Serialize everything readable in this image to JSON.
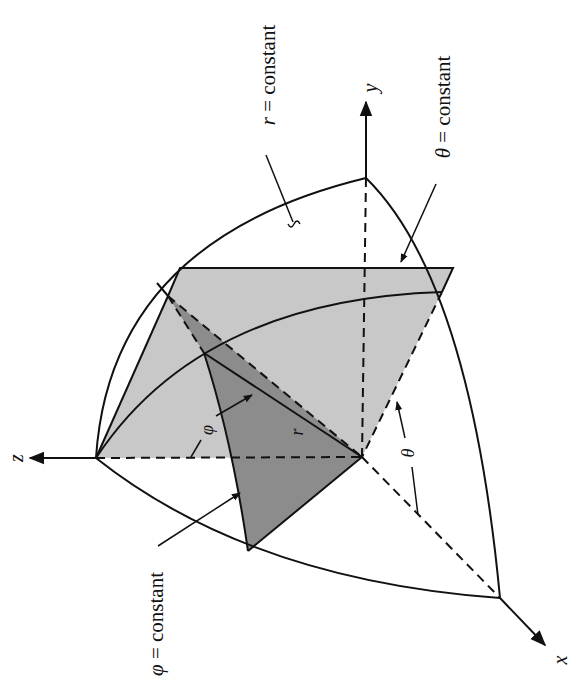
{
  "figure": {
    "colors": {
      "line": "#111111",
      "light_plane": "#c8c8c8",
      "dark_sector": "#8c8c8c",
      "background": "#ffffff"
    }
  },
  "axes": {
    "x": {
      "label": "x"
    },
    "y": {
      "label": "y"
    },
    "z": {
      "label": "z"
    }
  },
  "labels": {
    "r_surface": {
      "symbol": "r",
      "eq": " = constant"
    },
    "theta_surface": {
      "symbol": "θ",
      "eq": " = constant"
    },
    "phi_surface": {
      "symbol": "φ",
      "eq": " = constant"
    },
    "r_radius": "r",
    "phi_angle": "φ",
    "theta_angle": "θ"
  }
}
